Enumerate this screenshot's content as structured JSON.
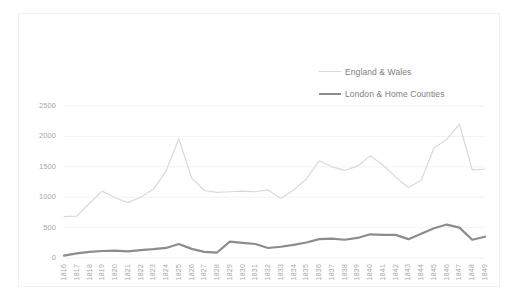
{
  "chart_data": {
    "type": "line",
    "title": "",
    "subtitle": "",
    "xlabel": "",
    "ylabel": "",
    "ylim": [
      0,
      2500
    ],
    "yticks": [
      0,
      500,
      1000,
      1500,
      2000,
      2500
    ],
    "grid": true,
    "legend_position": "top-right",
    "categories": [
      "1816",
      "1817",
      "1818",
      "1819",
      "1820",
      "1821",
      "1822",
      "1823",
      "1824",
      "1825",
      "1826",
      "1827",
      "1828",
      "1829",
      "1830",
      "1831",
      "1832",
      "1833",
      "1834",
      "1835",
      "1836",
      "1837",
      "1838",
      "1839",
      "1840",
      "1841",
      "1842",
      "1843",
      "1844",
      "1845",
      "1846",
      "1847",
      "1848",
      "1849"
    ],
    "series": [
      {
        "name": "England & Wales",
        "color": "#d9d9d9",
        "line_width": 1.2,
        "values": [
          680,
          690,
          900,
          1100,
          990,
          910,
          1000,
          1130,
          1430,
          1960,
          1320,
          1110,
          1080,
          1090,
          1100,
          1090,
          1120,
          980,
          1120,
          1300,
          1600,
          1500,
          1440,
          1510,
          1680,
          1530,
          1330,
          1160,
          1280,
          1810,
          1950,
          2200,
          1450,
          1460
        ]
      },
      {
        "name": "London & Home Counties",
        "color": "#8c8c8c",
        "line_width": 2.2,
        "values": [
          40,
          75,
          100,
          115,
          120,
          110,
          130,
          145,
          165,
          230,
          150,
          100,
          90,
          270,
          250,
          230,
          165,
          185,
          215,
          255,
          310,
          320,
          300,
          330,
          390,
          380,
          380,
          310,
          400,
          490,
          550,
          500,
          300,
          350
        ]
      }
    ]
  },
  "legend": {
    "items": [
      {
        "label": "England & Wales"
      },
      {
        "label": "London & Home Counties"
      }
    ]
  }
}
